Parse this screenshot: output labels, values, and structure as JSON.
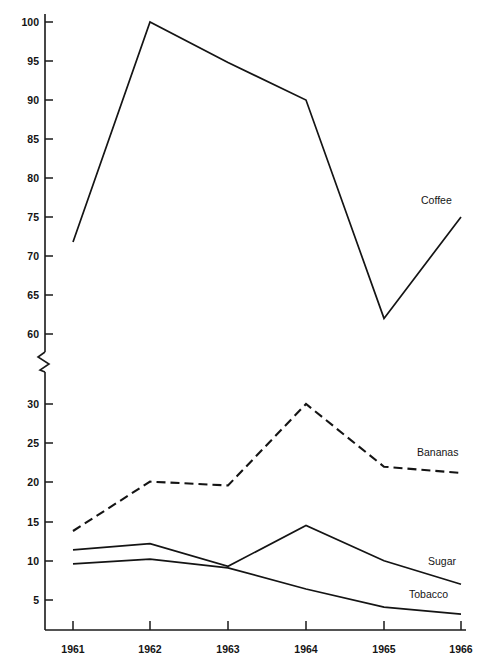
{
  "chart_data": {
    "type": "line",
    "title": "",
    "subtitle": "",
    "xlabel": "",
    "ylabel": "",
    "grid": false,
    "legend_position": "inline-right-of-line-ends",
    "axis_break": {
      "present": true,
      "between": [
        30,
        60
      ],
      "marker": "zigzag"
    },
    "x": [
      1961,
      1962,
      1963,
      1964,
      1965,
      1966
    ],
    "categories": [
      "1961",
      "1962",
      "1963",
      "1964",
      "1965",
      "1966"
    ],
    "x_tick_labels": [
      "1961",
      "1962",
      "1963",
      "1964",
      "1965",
      "1966"
    ],
    "y_tick_labels_upper": [
      "100",
      "95",
      "90",
      "85",
      "80",
      "75",
      "70",
      "65",
      "60"
    ],
    "y_tick_labels_lower": [
      "30",
      "25",
      "20",
      "15",
      "10",
      "5"
    ],
    "y_ticks_upper": [
      100,
      95,
      90,
      85,
      80,
      75,
      70,
      65,
      60
    ],
    "y_ticks_lower": [
      30,
      25,
      20,
      15,
      10,
      5
    ],
    "ylim_upper": [
      60,
      100
    ],
    "ylim_lower": [
      0,
      32
    ],
    "series": [
      {
        "name": "Coffee",
        "label": "Coffee",
        "style": "solid",
        "scale": "upper",
        "values": [
          71.8,
          100.0,
          94.8,
          90.0,
          62.0,
          75.0
        ]
      },
      {
        "name": "Bananas",
        "label": "Bananas",
        "style": "dashed",
        "scale": "lower",
        "values": [
          13.8,
          20.1,
          19.6,
          30.0,
          22.0,
          21.2
        ]
      },
      {
        "name": "Sugar",
        "label": "Sugar",
        "style": "solid",
        "scale": "lower",
        "values": [
          11.4,
          12.2,
          9.3,
          14.5,
          10.0,
          7.0
        ]
      },
      {
        "name": "Tobacco",
        "label": "Tobacco",
        "style": "solid",
        "scale": "lower",
        "values": [
          9.6,
          10.2,
          9.1,
          6.4,
          4.1,
          3.2
        ]
      }
    ]
  },
  "axis": {
    "y_labels": [
      {
        "text": "100"
      },
      {
        "text": "95"
      },
      {
        "text": "90"
      },
      {
        "text": "85"
      },
      {
        "text": "80"
      },
      {
        "text": "75"
      },
      {
        "text": "70"
      },
      {
        "text": "65"
      },
      {
        "text": "60"
      },
      {
        "text": "30"
      },
      {
        "text": "25"
      },
      {
        "text": "20"
      },
      {
        "text": "15"
      },
      {
        "text": "10"
      },
      {
        "text": "5"
      }
    ],
    "x_labels": [
      {
        "text": "1961"
      },
      {
        "text": "1962"
      },
      {
        "text": "1963"
      },
      {
        "text": "1964"
      },
      {
        "text": "1965"
      },
      {
        "text": "1966"
      }
    ]
  },
  "labels": {
    "coffee": "Coffee",
    "bananas": "Bananas",
    "sugar": "Sugar",
    "tobacco": "Tobacco"
  },
  "colors": {
    "ink": "#141414",
    "background": "#ffffff"
  }
}
